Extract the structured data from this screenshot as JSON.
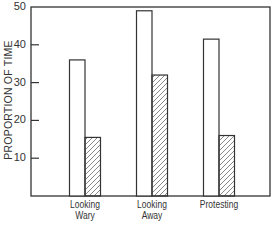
{
  "chart_data": {
    "type": "bar",
    "title": "",
    "xlabel": "",
    "ylabel": "PROPORTION OF TIME",
    "ylim": [
      0,
      50
    ],
    "yticks": [
      10,
      20,
      30,
      40,
      50
    ],
    "grid": false,
    "legend": null,
    "categories": [
      "Looking Wary",
      "Looking Away",
      "Protesting"
    ],
    "category_lines": [
      [
        "Looking",
        "Wary"
      ],
      [
        "Looking",
        "Away"
      ],
      [
        "Protesting"
      ]
    ],
    "series": [
      {
        "name": "open",
        "pattern": "none",
        "values": [
          36,
          49,
          41.5
        ]
      },
      {
        "name": "hatched",
        "pattern": "diagonal-hatch",
        "values": [
          15.5,
          32,
          16
        ]
      }
    ]
  },
  "colors": {
    "line": "#333333",
    "fill_open": "#ffffff",
    "hatch": "#444444"
  }
}
